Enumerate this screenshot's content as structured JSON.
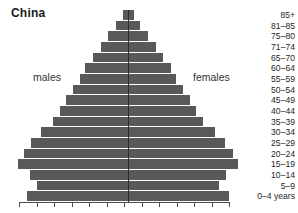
{
  "chart_data": {
    "type": "bar",
    "title": "China",
    "subtype": "population-pyramid",
    "xlabel": "",
    "ylabel": "",
    "grid": false,
    "legend_position": "inline",
    "categories": [
      "85+",
      "81–85",
      "75–80",
      "71–74",
      "65–70",
      "60–64",
      "55–59",
      "50–54",
      "45–49",
      "40–44",
      "35–39",
      "30–34",
      "25–29",
      "20–24",
      "15–19",
      "10–14",
      "5–9",
      "0–4 years"
    ],
    "series": [
      {
        "name": "males",
        "side": "left",
        "values": [
          5,
          11,
          18,
          25,
          32,
          39,
          44,
          50,
          56,
          62,
          68,
          79,
          88,
          95,
          100,
          89,
          83,
          92
        ]
      },
      {
        "name": "females",
        "side": "right",
        "values": [
          5,
          11,
          18,
          25,
          32,
          39,
          44,
          50,
          56,
          62,
          68,
          79,
          88,
          95,
          100,
          89,
          83,
          92
        ]
      }
    ],
    "axis_ticks": [
      "",
      "",
      "",
      "",
      "",
      "",
      "",
      "",
      "",
      "",
      "",
      "",
      ""
    ],
    "colors": {
      "bar": "#595959",
      "axis": "#4d4d4d",
      "text": "#1f1f1f",
      "title": "#1a1a1a"
    }
  },
  "labels": {
    "males": "males",
    "females": "females"
  }
}
